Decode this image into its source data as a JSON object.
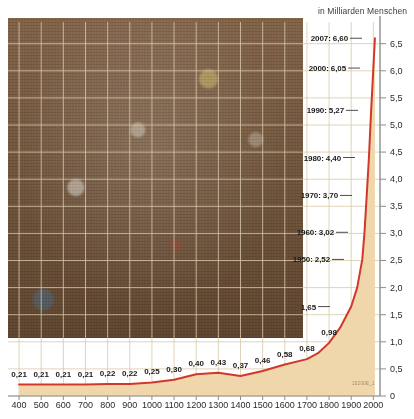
{
  "header": {
    "unit_note": "in Milliarden Menschen"
  },
  "photo": {
    "alt_name": "crowd-of-people-photograph"
  },
  "watermark": {
    "text": "10200E_1"
  },
  "chart_data": {
    "type": "area",
    "title": "",
    "subtitle": "",
    "xlabel": "",
    "ylabel": "in Milliarden Menschen",
    "xlim": [
      350,
      2030
    ],
    "ylim": [
      0,
      6.9
    ],
    "grid": true,
    "legend": null,
    "line_color": "#d2382a",
    "fill_color": "#f0d6ab",
    "axis_color": "#8d8d8d",
    "grid_color": "#d8c9a8",
    "x": [
      400,
      500,
      600,
      700,
      800,
      900,
      1000,
      1100,
      1200,
      1300,
      1400,
      1500,
      1600,
      1700,
      1750,
      1800,
      1850,
      1900,
      1927,
      1950,
      1960,
      1970,
      1980,
      1990,
      2000,
      2007
    ],
    "values": [
      0.21,
      0.21,
      0.21,
      0.21,
      0.22,
      0.22,
      0.25,
      0.3,
      0.4,
      0.43,
      0.37,
      0.46,
      0.58,
      0.68,
      0.79,
      0.98,
      1.26,
      1.65,
      2.0,
      2.52,
      3.02,
      3.7,
      4.4,
      5.27,
      6.05,
      6.6
    ],
    "x_ticks": [
      400,
      500,
      600,
      700,
      800,
      900,
      1000,
      1100,
      1200,
      1300,
      1400,
      1500,
      1600,
      1700,
      1800,
      1900,
      2000
    ],
    "x_tick_labels": [
      "400",
      "500",
      "600",
      "700",
      "800",
      "900",
      "1000",
      "1100",
      "1200",
      "1300",
      "1400",
      "1500",
      "1600",
      "1700",
      "1800",
      "1900",
      "2000"
    ],
    "y_ticks": [
      0,
      0.5,
      1.0,
      1.5,
      2.0,
      2.5,
      3.0,
      3.5,
      4.0,
      4.5,
      5.0,
      5.5,
      6.0,
      6.5
    ],
    "y_tick_labels": [
      "0",
      "0,5",
      "1,0",
      "1,5",
      "2,0",
      "2,5",
      "3,0",
      "3,5",
      "4,0",
      "4,5",
      "5,0",
      "5,5",
      "6,0",
      "6,5"
    ],
    "bottom_labels": [
      {
        "x": 400,
        "value": 0.21,
        "text": "0,21"
      },
      {
        "x": 500,
        "value": 0.21,
        "text": "0,21"
      },
      {
        "x": 600,
        "value": 0.21,
        "text": "0,21"
      },
      {
        "x": 700,
        "value": 0.21,
        "text": "0,21"
      },
      {
        "x": 800,
        "value": 0.22,
        "text": "0,22"
      },
      {
        "x": 900,
        "value": 0.22,
        "text": "0,22"
      },
      {
        "x": 1000,
        "value": 0.25,
        "text": "0,25"
      },
      {
        "x": 1100,
        "value": 0.3,
        "text": "0,30"
      },
      {
        "x": 1200,
        "value": 0.4,
        "text": "0,40"
      },
      {
        "x": 1300,
        "value": 0.43,
        "text": "0,43"
      },
      {
        "x": 1400,
        "value": 0.37,
        "text": "0,37"
      },
      {
        "x": 1500,
        "value": 0.46,
        "text": "0,46"
      },
      {
        "x": 1600,
        "value": 0.58,
        "text": "0,58"
      },
      {
        "x": 1700,
        "value": 0.68,
        "text": "0,68"
      },
      {
        "x": 1800,
        "value": 0.98,
        "text": "0,98"
      }
    ],
    "callouts": [
      {
        "text": "2007: 6,60",
        "year": 2007,
        "value": 6.6
      },
      {
        "text": "2000: 6,05",
        "year": 2000,
        "value": 6.05
      },
      {
        "text": "1990: 5,27",
        "year": 1990,
        "value": 5.27
      },
      {
        "text": "1980: 4,40",
        "year": 1980,
        "value": 4.4
      },
      {
        "text": "1970: 3,70",
        "year": 1970,
        "value": 3.7
      },
      {
        "text": "1960: 3,02",
        "year": 1960,
        "value": 3.02
      },
      {
        "text": "1950: 2,52",
        "year": 1950,
        "value": 2.52
      },
      {
        "text": "1,65",
        "year": 1900,
        "value": 1.65
      }
    ]
  }
}
